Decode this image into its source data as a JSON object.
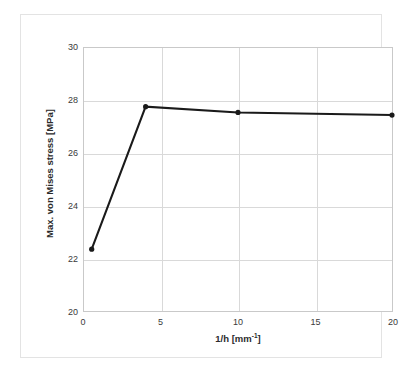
{
  "chart_data": {
    "type": "line",
    "title": "",
    "subtitle": "",
    "xlabel": "1/h [mm-1]",
    "xlabel_base": "1/h [mm",
    "xlabel_sup": "-1",
    "xlabel_tail": "]",
    "ylabel": "Max. von Mises stress [MPa]",
    "x": [
      0.5,
      4,
      10,
      20
    ],
    "values": [
      22.35,
      27.77,
      27.55,
      27.45
    ],
    "series": [
      {
        "name": "Max. von Mises stress",
        "x": [
          0.5,
          4,
          10,
          20
        ],
        "values": [
          22.35,
          27.77,
          27.55,
          27.45
        ]
      }
    ],
    "xlim": [
      0,
      20
    ],
    "ylim": [
      20,
      30
    ],
    "xticks": [
      0,
      5,
      10,
      15,
      20
    ],
    "yticks": [
      20,
      22,
      24,
      26,
      28,
      30
    ],
    "xtick_labels": [
      "0",
      "5",
      "10",
      "15",
      "20"
    ],
    "ytick_labels": [
      "20",
      "22",
      "24",
      "26",
      "28",
      "30"
    ],
    "grid": true,
    "grid_axes": "both",
    "legend": false,
    "legend_position": "none",
    "line_color": "#1a1a1a",
    "marker_color": "#1a1a1a",
    "marker": "circle",
    "grid_color": "#d9d9d9",
    "axis_color": "#c9c9c9",
    "background_color": "#ffffff",
    "annotations": []
  }
}
